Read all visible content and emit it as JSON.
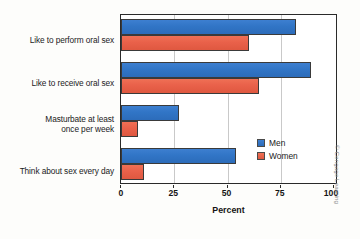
{
  "chart_data": {
    "type": "bar",
    "orientation": "horizontal",
    "title": "",
    "xlabel": "Percent",
    "ylabel": "",
    "xlim": [
      0,
      100
    ],
    "xticks": [
      0,
      25,
      50,
      75,
      100
    ],
    "grid": true,
    "legend_position": "inside-right",
    "categories": [
      "Like to perform oral sex",
      "Like to receive oral sex",
      "Masturbate at least once per week",
      "Think about sex every day"
    ],
    "series": [
      {
        "name": "Men",
        "color": "#3175C6",
        "values": [
          82,
          89,
          27,
          54
        ]
      },
      {
        "name": "Women",
        "color": "#E9614A",
        "values": [
          60,
          65,
          8,
          11
        ]
      }
    ]
  },
  "axis": {
    "x_title": "Percent",
    "tick_labels": [
      "0",
      "25",
      "50",
      "75",
      "100"
    ]
  },
  "categories": [
    {
      "line1": "Like to perform oral sex",
      "line2": ""
    },
    {
      "line1": "Like to receive oral sex",
      "line2": ""
    },
    {
      "line1": "Masturbate at least",
      "line2": "once per week"
    },
    {
      "line1": "Think about sex every day",
      "line2": ""
    }
  ],
  "legend": {
    "items": [
      {
        "label": "Men"
      },
      {
        "label": "Women"
      }
    ]
  },
  "credit": "© Cengage Learning"
}
